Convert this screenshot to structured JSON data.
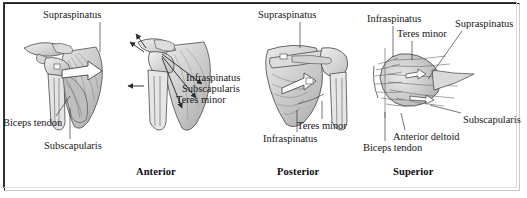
{
  "figure": {
    "title_alt": "Rotator cuff muscles of the shoulder — anterior, posterior and superior views",
    "background": "#ffffff",
    "frame_color": "#2a2a2a",
    "ink_color": "#17171a"
  },
  "captions": [
    {
      "id": "caption-anterior",
      "label": "Anterior",
      "x": 136,
      "y": 166
    },
    {
      "id": "caption-posterior",
      "label": "Posterior",
      "x": 277,
      "y": 166
    },
    {
      "id": "caption-superior",
      "label": "Superior",
      "x": 393,
      "y": 166
    }
  ],
  "panels": [
    {
      "id": "panel-anterior-muscles",
      "view": "Anterior",
      "labels": [
        {
          "id": "label-supraspinatus-1",
          "text": "Supraspinatus",
          "x": 43,
          "y": 9,
          "leader": [
            [
              100,
              22
            ],
            [
              100,
              52
            ]
          ]
        },
        {
          "id": "label-biceps-tendon-1",
          "text": "Biceps tendon",
          "x": 3,
          "y": 117,
          "leader": [
            [
              56,
              116
            ],
            [
              70,
              96
            ]
          ]
        },
        {
          "id": "label-subscapularis-1",
          "text": "Subscapularis",
          "x": 44,
          "y": 140,
          "leader": [
            [
              70,
              139
            ],
            [
              70,
              108
            ]
          ]
        }
      ]
    },
    {
      "id": "panel-anterior-arrows",
      "view": "Anterior (force vectors)",
      "labels": [
        {
          "id": "label-infraspinatus-1",
          "text": "Infraspinatus",
          "x": 186,
          "y": 72
        },
        {
          "id": "label-subscapularis-2",
          "text": "Subscapularis",
          "x": 182,
          "y": 83
        },
        {
          "id": "label-teres-minor-1",
          "text": "Teres minor",
          "x": 176,
          "y": 94
        }
      ]
    },
    {
      "id": "panel-posterior",
      "view": "Posterior",
      "labels": [
        {
          "id": "label-supraspinatus-2",
          "text": "Supraspinatus",
          "x": 258,
          "y": 9,
          "leader": [
            [
              300,
              22
            ],
            [
              300,
              48
            ]
          ]
        },
        {
          "id": "label-teres-minor-2",
          "text": "Teres minor",
          "x": 297,
          "y": 120,
          "leader": [
            [
              322,
              119
            ],
            [
              322,
              101
            ]
          ]
        },
        {
          "id": "label-infraspinatus-2",
          "text": "Infraspinatus",
          "x": 263,
          "y": 133,
          "leader": [
            [
              297,
              132
            ],
            [
              297,
              110
            ]
          ]
        }
      ]
    },
    {
      "id": "panel-superior",
      "view": "Superior",
      "labels": [
        {
          "id": "label-infraspinatus-3",
          "text": "Infraspinatus",
          "x": 367,
          "y": 13,
          "leader": [
            [
              393,
              26
            ],
            [
              393,
              57
            ]
          ]
        },
        {
          "id": "label-teres-minor-3",
          "text": "Teres minor",
          "x": 397,
          "y": 28,
          "leader": [
            [
              412,
              41
            ],
            [
              412,
              60
            ]
          ]
        },
        {
          "id": "label-supraspinatus-3",
          "text": "Supraspinatus",
          "x": 457,
          "y": 18,
          "leader": [
            [
              462,
              31
            ],
            [
              428,
              79
            ]
          ]
        },
        {
          "id": "label-subscapularis-3",
          "text": "Subscapularis",
          "x": 463,
          "y": 114,
          "leader": [
            [
              461,
              113
            ],
            [
              430,
              105
            ]
          ]
        },
        {
          "id": "label-anterior-deltoid",
          "text": "Anterior deltoid",
          "x": 393,
          "y": 131,
          "leader": [
            [
              405,
              130
            ],
            [
              401,
              113
            ]
          ]
        },
        {
          "id": "label-biceps-tendon-2",
          "text": "Biceps tendon",
          "x": 363,
          "y": 142,
          "leader": [
            [
              385,
              141
            ],
            [
              385,
              112
            ]
          ]
        }
      ]
    }
  ]
}
